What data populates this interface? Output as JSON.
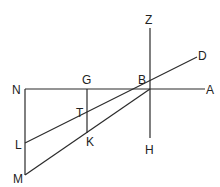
{
  "diagram": {
    "type": "geometric-line-diagram",
    "labels": {
      "N": "N",
      "G": "G",
      "B": "B",
      "A": "A",
      "Z": "Z",
      "D": "D",
      "H": "H",
      "T": "T",
      "L": "L",
      "K": "K",
      "M": "M"
    },
    "points": {
      "N": [
        25,
        89
      ],
      "G": [
        87,
        89
      ],
      "B": [
        150,
        89
      ],
      "A": [
        205,
        89
      ],
      "Z": [
        150,
        28
      ],
      "H": [
        150,
        138
      ],
      "D": [
        197,
        57
      ],
      "T": [
        87,
        118
      ],
      "L": [
        25,
        143
      ],
      "K": [
        87,
        133
      ],
      "M": [
        25,
        175
      ]
    },
    "segments": [
      [
        "N",
        "A"
      ],
      [
        "Z",
        "H"
      ],
      [
        "N",
        "M"
      ],
      [
        "G",
        "K"
      ],
      [
        "L",
        "D"
      ],
      [
        "M",
        "B"
      ]
    ],
    "colors": {
      "line": "#2a2a2a",
      "text": "#222222",
      "background": "#ffffff"
    }
  }
}
